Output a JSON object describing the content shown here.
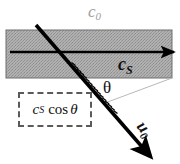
{
  "figure": {
    "width": 180,
    "height": 164,
    "background_color": "#ffffff"
  },
  "labels": {
    "outer_medium": {
      "symbol": "c",
      "subscript": "0",
      "color": "#a0a0a0"
    },
    "slab_medium": {
      "symbol": "c",
      "subscript": "S",
      "color": "#111111"
    },
    "angle": {
      "symbol": "θ",
      "color": "#111111"
    },
    "projection_box": {
      "symbol": "c",
      "subscript": "S",
      "operator": "cos",
      "argument": "θ",
      "border_color": "#5a5a5a"
    },
    "beam_velocity": {
      "symbol": "u",
      "subscript": "0",
      "color": "#111111",
      "rotation_deg": 52
    }
  },
  "geometry": {
    "band": {
      "x": 6,
      "y": 30,
      "width": 166,
      "height": 48,
      "fill": "#a8a8a8",
      "stroke": "#6e6e6e"
    },
    "horizontal_arrow": {
      "x1": 10,
      "y1": 52,
      "x2": 178,
      "y2": 52,
      "color": "#000000"
    },
    "diagonal_arrow": {
      "x1": 36,
      "y1": 25,
      "x2": 152,
      "y2": 158,
      "color": "#000000"
    },
    "angle_ray": {
      "x1": 105,
      "y1": 103,
      "x2": 172,
      "y2": 78,
      "color": "#b5b5b5"
    },
    "hatch_marks": {
      "from": [
        70,
        65
      ],
      "to": [
        112,
        110
      ],
      "count": 16,
      "color": "#000000"
    }
  }
}
